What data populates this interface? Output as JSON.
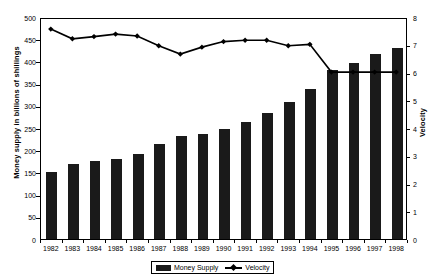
{
  "chart_data": {
    "type": "bar",
    "title": "",
    "xlabel": "",
    "ylabel": "Money supply in billions of shillings",
    "y2label": "Velocity",
    "ylim": [
      0,
      500
    ],
    "y2lim": [
      0,
      8
    ],
    "yticks": [
      0,
      50,
      100,
      150,
      200,
      250,
      300,
      350,
      400,
      450,
      500
    ],
    "y2ticks": [
      0,
      1,
      2,
      3,
      4,
      5,
      6,
      7,
      8
    ],
    "grid": false,
    "legend_position": "bottom",
    "categories": [
      "1982",
      "1983",
      "1984",
      "1985",
      "1986",
      "1987",
      "1988",
      "1989",
      "1990",
      "1991",
      "1992",
      "1993",
      "1994",
      "1995",
      "1996",
      "1997",
      "1998"
    ],
    "series": [
      {
        "name": "Money Supply",
        "type": "bar",
        "axis": "left",
        "color": "#1a1a1a",
        "values": [
          152,
          169,
          176,
          181,
          192,
          215,
          231,
          236,
          248,
          263,
          283,
          308,
          337,
          380,
          397,
          417,
          430
        ]
      },
      {
        "name": "Velocity",
        "type": "line",
        "axis": "right",
        "color": "#000000",
        "marker": "diamond",
        "values": [
          7.6,
          7.25,
          7.33,
          7.42,
          7.35,
          7.0,
          6.7,
          6.95,
          7.15,
          7.2,
          7.2,
          7.0,
          7.05,
          6.05,
          6.05,
          6.05,
          6.05
        ]
      }
    ]
  },
  "legend": {
    "items": [
      {
        "label": "Money Supply",
        "marker": "bar-swatch"
      },
      {
        "label": "Velocity",
        "marker": "line-diamond-swatch"
      }
    ]
  }
}
